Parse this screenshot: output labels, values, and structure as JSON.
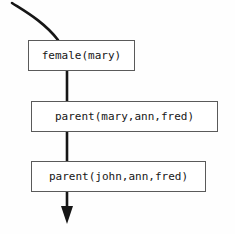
{
  "figure": {
    "type": "flowchart",
    "background_color": "#fefefe",
    "stroke_color": "#161616",
    "box_border_color": "#5a5a5a",
    "nodes": [
      {
        "id": "female-mary",
        "label": "female(mary)"
      },
      {
        "id": "parent-mary-ann-fred",
        "label": "parent(mary,ann,fred)"
      },
      {
        "id": "parent-john-ann-fred",
        "label": "parent(john,ann,fred)"
      }
    ],
    "incoming_arrow": {
      "name": "curved-inbound-arrow",
      "description": "curve entering from upper-left into top of first box"
    },
    "outgoing_arrow": {
      "name": "downward-arrowhead",
      "description": "solid triangular arrowhead pointing down below last box"
    }
  },
  "page_bleed": {
    "top_fragment": "",
    "bottom_fragment": ""
  }
}
